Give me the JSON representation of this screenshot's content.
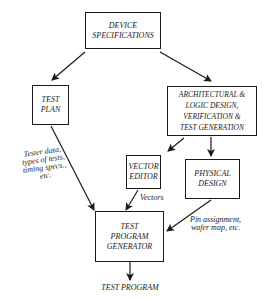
{
  "diagram": {
    "nodes": {
      "device_specifications": {
        "lines": [
          "DEVICE",
          "SPECIFICATIONS"
        ]
      },
      "test_plan": {
        "lines": [
          "TEST",
          "PLAN"
        ]
      },
      "arch_logic": {
        "lines": [
          "ARCHITECTURAL &",
          "LOGIC DESIGN,",
          "VERIFICATION &",
          "TEST GENERATION"
        ]
      },
      "vector_editor": {
        "lines": [
          "VECTOR",
          "EDITOR"
        ]
      },
      "physical_design": {
        "lines": [
          "PHYSICAL",
          "DESIGN"
        ]
      },
      "test_program_generator": {
        "lines": [
          "TEST",
          "PROGRAM",
          "GENERATOR"
        ]
      }
    },
    "edge_labels": {
      "tester_data": {
        "lines": [
          "Tester data,",
          "types of tests,",
          "timing specs.,",
          "etc."
        ]
      },
      "vectors": {
        "lines": [
          "Vectors"
        ]
      },
      "pin_assignment": {
        "lines": [
          "Pin assignment,",
          "wafer map, etc."
        ]
      }
    },
    "output_label": "TEST PROGRAM",
    "edges": [
      {
        "from": "DEVICE SPECIFICATIONS",
        "to": "TEST PLAN"
      },
      {
        "from": "DEVICE SPECIFICATIONS",
        "to": "ARCHITECTURAL & LOGIC DESIGN, VERIFICATION & TEST GENERATION"
      },
      {
        "from": "ARCHITECTURAL & LOGIC DESIGN, VERIFICATION & TEST GENERATION",
        "to": "VECTOR EDITOR"
      },
      {
        "from": "ARCHITECTURAL & LOGIC DESIGN, VERIFICATION & TEST GENERATION",
        "to": "PHYSICAL DESIGN"
      },
      {
        "from": "TEST PLAN",
        "to": "TEST PROGRAM GENERATOR",
        "label": "Tester data, types of tests, timing specs., etc."
      },
      {
        "from": "VECTOR EDITOR",
        "to": "TEST PROGRAM GENERATOR",
        "label": "Vectors"
      },
      {
        "from": "PHYSICAL DESIGN",
        "to": "TEST PROGRAM GENERATOR",
        "label": "Pin assignment, wafer map, etc."
      },
      {
        "from": "TEST PROGRAM GENERATOR",
        "to": "TEST PROGRAM"
      }
    ]
  }
}
